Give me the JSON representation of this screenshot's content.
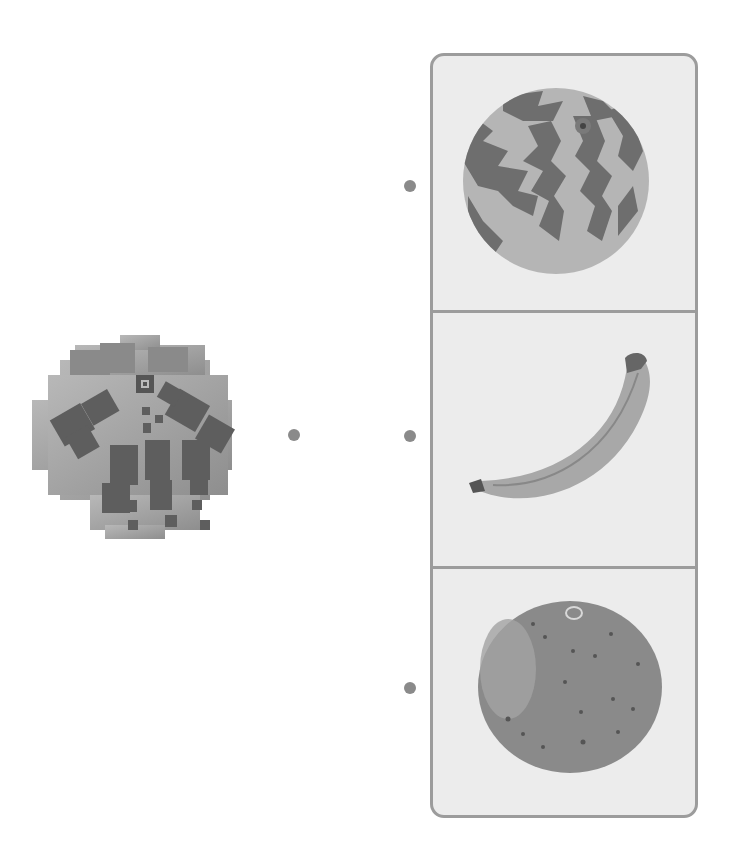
{
  "exercise": {
    "type": "matching",
    "prompt_image": {
      "label": "pixelated-watermelon",
      "description": "Mosaic pixelated watermelon"
    },
    "options": [
      {
        "label": "watermelon"
      },
      {
        "label": "banana"
      },
      {
        "label": "orange"
      }
    ]
  },
  "colors": {
    "panel_bg": "#ececec",
    "panel_border": "#9c9c9c",
    "dot": "#8a8a8a"
  }
}
